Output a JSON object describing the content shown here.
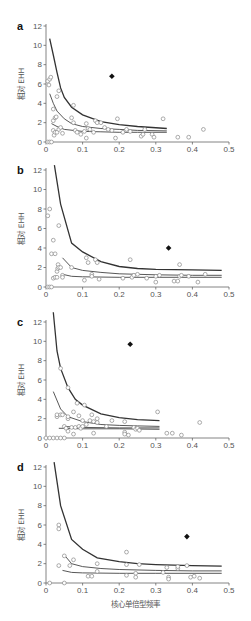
{
  "figure": {
    "y_axis_title": "相对 EHH",
    "x_axis_title": "核心单倍型频率"
  },
  "chart_data": [
    {
      "panel": "a",
      "type": "scatter",
      "xlabel": "",
      "ylabel": "相对 EHH",
      "xlim": [
        0,
        0.5
      ],
      "ylim": [
        0,
        12
      ],
      "xticks": [
        "0",
        "0.1",
        "0.2",
        "0.3",
        "0.4",
        "0.5"
      ],
      "yticks": [
        "0",
        "2",
        "4",
        "6",
        "8",
        "10",
        "12"
      ],
      "grid": false,
      "curves": [
        {
          "name": "upper",
          "x": [
            0.01,
            0.02,
            0.03,
            0.04,
            0.05,
            0.07,
            0.1,
            0.15,
            0.2,
            0.25,
            0.33
          ],
          "y": [
            10.7,
            9.0,
            7.2,
            5.6,
            4.6,
            3.6,
            2.8,
            2.1,
            1.8,
            1.6,
            1.4
          ]
        },
        {
          "name": "middle",
          "x": [
            0.01,
            0.02,
            0.03,
            0.05,
            0.07,
            0.1,
            0.15,
            0.2,
            0.25,
            0.33
          ],
          "y": [
            5.0,
            4.0,
            3.2,
            2.4,
            1.9,
            1.6,
            1.4,
            1.3,
            1.2,
            1.15
          ]
        },
        {
          "name": "lower",
          "x": [
            0.015,
            0.03,
            0.05,
            0.1,
            0.15,
            0.2,
            0.25,
            0.33
          ],
          "y": [
            1.9,
            1.6,
            1.3,
            1.1,
            1.05,
            1.0,
            1.0,
            1.0
          ]
        }
      ],
      "points": [
        [
          0.005,
          0
        ],
        [
          0.01,
          0
        ],
        [
          0.015,
          0
        ],
        [
          0.005,
          6.3
        ],
        [
          0.008,
          5.9
        ],
        [
          0.01,
          6.5
        ],
        [
          0.013,
          6.7
        ],
        [
          0.02,
          3.4
        ],
        [
          0.02,
          2.2
        ],
        [
          0.025,
          2.5
        ],
        [
          0.028,
          2.6
        ],
        [
          0.03,
          4.7
        ],
        [
          0.035,
          5.3
        ],
        [
          0.02,
          1.2
        ],
        [
          0.022,
          0.7
        ],
        [
          0.025,
          1.0
        ],
        [
          0.03,
          1.0
        ],
        [
          0.035,
          1.3
        ],
        [
          0.04,
          1.5
        ],
        [
          0.045,
          0.9
        ],
        [
          0.07,
          2.5
        ],
        [
          0.075,
          3.8
        ],
        [
          0.075,
          2.0
        ],
        [
          0.08,
          1.2
        ],
        [
          0.085,
          1.0
        ],
        [
          0.095,
          0.8
        ],
        [
          0.105,
          1.1
        ],
        [
          0.11,
          0.4
        ],
        [
          0.11,
          1.9
        ],
        [
          0.115,
          1.4
        ],
        [
          0.12,
          1.3
        ],
        [
          0.13,
          1.0
        ],
        [
          0.135,
          2.2
        ],
        [
          0.14,
          2.0
        ],
        [
          0.15,
          2.0
        ],
        [
          0.16,
          1.5
        ],
        [
          0.17,
          1.3
        ],
        [
          0.18,
          1.2
        ],
        [
          0.19,
          0.4
        ],
        [
          0.195,
          2.4
        ],
        [
          0.21,
          1.0
        ],
        [
          0.22,
          1.3
        ],
        [
          0.23,
          1.1
        ],
        [
          0.26,
          0.6
        ],
        [
          0.265,
          0.8
        ],
        [
          0.27,
          1.3
        ],
        [
          0.29,
          0.8
        ],
        [
          0.295,
          0.5
        ],
        [
          0.32,
          2.4
        ],
        [
          0.36,
          0.5
        ],
        [
          0.39,
          0.5
        ],
        [
          0.43,
          1.3
        ]
      ],
      "highlight": {
        "x": 0.18,
        "y": 6.8
      }
    },
    {
      "panel": "b",
      "type": "scatter",
      "xlabel": "",
      "ylabel": "相对 EHH",
      "xlim": [
        0,
        0.5
      ],
      "ylim": [
        0,
        12
      ],
      "xticks": [
        "0",
        "0.1",
        "0.2",
        "0.3",
        "0.4",
        "0.5"
      ],
      "yticks": [
        "0",
        "2",
        "4",
        "6",
        "8",
        "10",
        "12"
      ],
      "grid": false,
      "curves": [
        {
          "name": "upper",
          "x": [
            0.023,
            0.04,
            0.07,
            0.1,
            0.15,
            0.2,
            0.25,
            0.3,
            0.4,
            0.48
          ],
          "y": [
            12.5,
            8.5,
            4.5,
            3.6,
            2.6,
            2.1,
            1.9,
            1.8,
            1.75,
            1.7
          ]
        },
        {
          "name": "middle",
          "x": [
            0.045,
            0.07,
            0.1,
            0.15,
            0.2,
            0.3,
            0.4,
            0.48
          ],
          "y": [
            3.0,
            2.0,
            1.7,
            1.5,
            1.35,
            1.25,
            1.2,
            1.2
          ]
        },
        {
          "name": "lower",
          "x": [
            0.045,
            0.07,
            0.1,
            0.2,
            0.3,
            0.48
          ],
          "y": [
            1.3,
            1.1,
            1.05,
            1.0,
            1.0,
            1.0
          ]
        }
      ],
      "points": [
        [
          0.005,
          0
        ],
        [
          0.01,
          0
        ],
        [
          0.015,
          0
        ],
        [
          0.005,
          7.3
        ],
        [
          0.01,
          8.0
        ],
        [
          0.02,
          4.8
        ],
        [
          0.015,
          3.4
        ],
        [
          0.025,
          3.4
        ],
        [
          0.035,
          6.3
        ],
        [
          0.02,
          0.9
        ],
        [
          0.025,
          1.0
        ],
        [
          0.03,
          1.0
        ],
        [
          0.03,
          1.6
        ],
        [
          0.032,
          1.9
        ],
        [
          0.033,
          2.3
        ],
        [
          0.035,
          2.0
        ],
        [
          0.04,
          2.0
        ],
        [
          0.045,
          1.2
        ],
        [
          0.045,
          1.0
        ],
        [
          0.07,
          2.0
        ],
        [
          0.105,
          0.7
        ],
        [
          0.11,
          3.0
        ],
        [
          0.115,
          2.5
        ],
        [
          0.125,
          1.3
        ],
        [
          0.125,
          1.1
        ],
        [
          0.135,
          2.8
        ],
        [
          0.14,
          2.5
        ],
        [
          0.145,
          0.8
        ],
        [
          0.21,
          0.9
        ],
        [
          0.23,
          2.8
        ],
        [
          0.235,
          1.0
        ],
        [
          0.24,
          1.2
        ],
        [
          0.25,
          1.3
        ],
        [
          0.275,
          0.9
        ],
        [
          0.3,
          0.5
        ],
        [
          0.3,
          1.1
        ],
        [
          0.31,
          1.2
        ],
        [
          0.35,
          0.6
        ],
        [
          0.36,
          0.6
        ],
        [
          0.365,
          2.3
        ],
        [
          0.365,
          1.1
        ],
        [
          0.37,
          1.2
        ],
        [
          0.39,
          1.1
        ],
        [
          0.415,
          0.5
        ],
        [
          0.435,
          1.3
        ]
      ],
      "highlight": {
        "x": 0.335,
        "y": 4.0
      }
    },
    {
      "panel": "c",
      "type": "scatter",
      "xlabel": "",
      "ylabel": "相对 EHH",
      "xlim": [
        0,
        0.5
      ],
      "ylim": [
        0,
        12
      ],
      "xticks": [
        "0",
        "0.1",
        "0.2",
        "0.3",
        "0.4",
        "0.5"
      ],
      "yticks": [
        "0",
        "2",
        "4",
        "6",
        "8",
        "10",
        "12"
      ],
      "grid": false,
      "curves": [
        {
          "name": "upper",
          "x": [
            0.02,
            0.03,
            0.04,
            0.06,
            0.08,
            0.1,
            0.15,
            0.2,
            0.25,
            0.31
          ],
          "y": [
            13.0,
            9.0,
            7.2,
            5.2,
            4.0,
            3.4,
            2.5,
            2.1,
            1.9,
            1.8
          ]
        },
        {
          "name": "middle",
          "x": [
            0.02,
            0.04,
            0.06,
            0.1,
            0.15,
            0.2,
            0.25,
            0.31
          ],
          "y": [
            4.8,
            3.0,
            2.2,
            1.7,
            1.4,
            1.3,
            1.25,
            1.2
          ]
        },
        {
          "name": "lower",
          "x": [
            0.035,
            0.05,
            0.1,
            0.2,
            0.31
          ],
          "y": [
            1.0,
            1.0,
            0.95,
            0.95,
            0.9
          ]
        },
        {
          "name": "lowest",
          "x": [
            0.05,
            0.07,
            0.1,
            0.2,
            0.31
          ],
          "y": [
            1.2,
            1.15,
            1.1,
            1.05,
            1.05
          ]
        }
      ],
      "points": [
        [
          0,
          0
        ],
        [
          0.01,
          0
        ],
        [
          0.02,
          0
        ],
        [
          0.03,
          0
        ],
        [
          0.04,
          0
        ],
        [
          0.05,
          0
        ],
        [
          0.04,
          7.2
        ],
        [
          0.06,
          5.2
        ],
        [
          0.03,
          2.2
        ],
        [
          0.03,
          2.4
        ],
        [
          0.04,
          2.4
        ],
        [
          0.045,
          2.4
        ],
        [
          0.05,
          1.2
        ],
        [
          0.055,
          1.0
        ],
        [
          0.06,
          2.0
        ],
        [
          0.06,
          2.2
        ],
        [
          0.06,
          0.7
        ],
        [
          0.07,
          1.1
        ],
        [
          0.075,
          2.7
        ],
        [
          0.075,
          0.4
        ],
        [
          0.08,
          1.1
        ],
        [
          0.085,
          3.6
        ],
        [
          0.09,
          2.3
        ],
        [
          0.09,
          1.2
        ],
        [
          0.095,
          1.0
        ],
        [
          0.1,
          1.8
        ],
        [
          0.1,
          1.2
        ],
        [
          0.105,
          3.4
        ],
        [
          0.11,
          1.4
        ],
        [
          0.12,
          1.8
        ],
        [
          0.125,
          2.4
        ],
        [
          0.13,
          0.5
        ],
        [
          0.13,
          1.7
        ],
        [
          0.14,
          2.0
        ],
        [
          0.14,
          1.6
        ],
        [
          0.165,
          1.2
        ],
        [
          0.18,
          1.8
        ],
        [
          0.215,
          1.7
        ],
        [
          0.215,
          0.6
        ],
        [
          0.215,
          0.4
        ],
        [
          0.225,
          0.3
        ],
        [
          0.24,
          1.1
        ],
        [
          0.245,
          0.9
        ],
        [
          0.25,
          1.0
        ],
        [
          0.255,
          0.8
        ],
        [
          0.305,
          2.7
        ],
        [
          0.33,
          0.5
        ],
        [
          0.345,
          0.5
        ],
        [
          0.37,
          0.3
        ],
        [
          0.42,
          1.6
        ]
      ],
      "highlight": {
        "x": 0.23,
        "y": 9.7
      }
    },
    {
      "panel": "d",
      "type": "scatter",
      "xlabel": "核心单倍型频率",
      "ylabel": "相对 EHH",
      "xlim": [
        0,
        0.5
      ],
      "ylim": [
        0,
        12
      ],
      "xticks": [
        "0",
        "0.1",
        "0.2",
        "0.3",
        "0.4",
        "0.5"
      ],
      "yticks": [
        "0",
        "2",
        "4",
        "6",
        "8",
        "10",
        "12"
      ],
      "grid": false,
      "curves": [
        {
          "name": "upper",
          "x": [
            0.022,
            0.04,
            0.07,
            0.1,
            0.14,
            0.2,
            0.25,
            0.3,
            0.4,
            0.48
          ],
          "y": [
            12.5,
            8.0,
            4.5,
            3.5,
            2.6,
            2.2,
            2.0,
            1.9,
            1.8,
            1.75
          ]
        },
        {
          "name": "middle",
          "x": [
            0.05,
            0.07,
            0.1,
            0.15,
            0.2,
            0.3,
            0.4,
            0.48
          ],
          "y": [
            2.9,
            2.0,
            1.7,
            1.5,
            1.4,
            1.3,
            1.25,
            1.25
          ]
        },
        {
          "name": "lower",
          "x": [
            0.045,
            0.07,
            0.1,
            0.2,
            0.3,
            0.48
          ],
          "y": [
            1.3,
            1.1,
            1.05,
            1.0,
            1.0,
            1.0
          ]
        }
      ],
      "points": [
        [
          0.01,
          0
        ],
        [
          0.05,
          0
        ],
        [
          0.035,
          6.0
        ],
        [
          0.035,
          5.6
        ],
        [
          0.035,
          1.8
        ],
        [
          0.05,
          2.8
        ],
        [
          0.065,
          1.8
        ],
        [
          0.075,
          2.4
        ],
        [
          0.115,
          0.7
        ],
        [
          0.125,
          0.7
        ],
        [
          0.14,
          2.0
        ],
        [
          0.14,
          1.2
        ],
        [
          0.22,
          3.2
        ],
        [
          0.22,
          1.9
        ],
        [
          0.22,
          0.8
        ],
        [
          0.245,
          1.0
        ],
        [
          0.245,
          0.6
        ],
        [
          0.255,
          1.9
        ],
        [
          0.32,
          1.1
        ],
        [
          0.33,
          1.6
        ],
        [
          0.335,
          0.6
        ],
        [
          0.335,
          0.4
        ],
        [
          0.36,
          1.5
        ],
        [
          0.36,
          1.7
        ],
        [
          0.385,
          1.8
        ],
        [
          0.395,
          0.6
        ],
        [
          0.405,
          0.7
        ],
        [
          0.42,
          0.5
        ]
      ],
      "highlight": {
        "x": 0.385,
        "y": 4.8
      }
    }
  ]
}
